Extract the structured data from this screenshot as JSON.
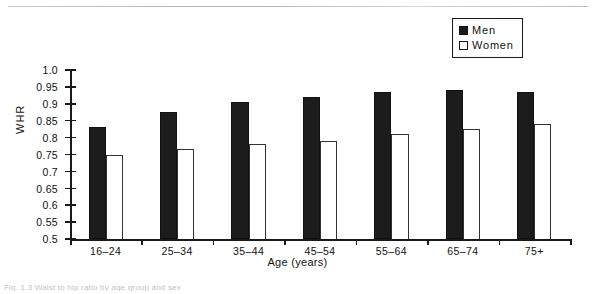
{
  "legend": {
    "items": [
      {
        "label": "Men",
        "swatch": "filled-square-icon",
        "color": "#1c1c1c"
      },
      {
        "label": "Women",
        "swatch": "open-square-icon",
        "color": "#ffffff"
      }
    ]
  },
  "caption": {
    "text": "Fig. 1.3   Waist to hip ratio by age group and sex"
  },
  "chart_data": {
    "type": "bar",
    "title": "",
    "xlabel": "Age (years)",
    "ylabel": "WHR",
    "categories": [
      "16–24",
      "25–34",
      "35–44",
      "45–54",
      "55–64",
      "65–74",
      "75+"
    ],
    "series": [
      {
        "name": "Men",
        "color": "#1c1c1c",
        "values": [
          0.83,
          0.875,
          0.905,
          0.92,
          0.935,
          0.94,
          0.935
        ]
      },
      {
        "name": "Women",
        "color": "#ffffff",
        "values": [
          0.75,
          0.765,
          0.78,
          0.79,
          0.81,
          0.825,
          0.84
        ]
      }
    ],
    "ylim": [
      0.5,
      1.0
    ],
    "ytick_labels": [
      "1.0",
      "0.95",
      "0.9",
      "0.85",
      "0.8",
      "0.75",
      "0.7",
      "0.65",
      "0.6",
      "0.55",
      "0.5"
    ],
    "ytick_values": [
      1.0,
      0.95,
      0.9,
      0.85,
      0.8,
      0.75,
      0.7,
      0.65,
      0.6,
      0.55,
      0.5
    ],
    "grid": false,
    "legend_position": "top-right"
  }
}
